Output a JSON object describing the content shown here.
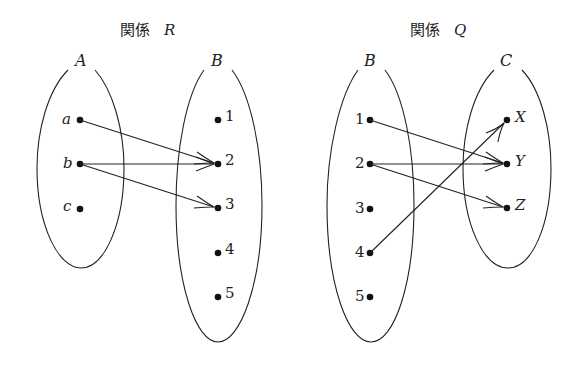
{
  "diagrams": [
    {
      "title_prefix": "関係",
      "title_var": "R",
      "domain_set": {
        "label": "A",
        "elements": [
          "a",
          "b",
          "c"
        ]
      },
      "codomain_set": {
        "label": "B",
        "elements": [
          "1",
          "2",
          "3",
          "4",
          "5"
        ]
      },
      "mappings": [
        {
          "from": "a",
          "to": "2"
        },
        {
          "from": "b",
          "to": "2"
        },
        {
          "from": "b",
          "to": "3"
        }
      ]
    },
    {
      "title_prefix": "関係",
      "title_var": "Q",
      "domain_set": {
        "label": "B",
        "elements": [
          "1",
          "2",
          "3",
          "4",
          "5"
        ]
      },
      "codomain_set": {
        "label": "C",
        "elements": [
          "X",
          "Y",
          "Z"
        ]
      },
      "mappings": [
        {
          "from": "1",
          "to": "Y"
        },
        {
          "from": "2",
          "to": "Y"
        },
        {
          "from": "2",
          "to": "Z"
        },
        {
          "from": "4",
          "to": "X"
        }
      ]
    }
  ]
}
